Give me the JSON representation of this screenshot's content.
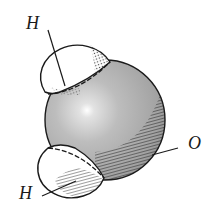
{
  "diagram": {
    "title": "",
    "atoms": [
      {
        "id": "h-top",
        "label": "H",
        "element": "hydrogen",
        "fill": "#ffffff"
      },
      {
        "id": "o",
        "label": "O",
        "element": "oxygen",
        "fill": "#b4b4b4"
      },
      {
        "id": "h-bottom",
        "label": "H",
        "element": "hydrogen",
        "fill": "#ffffff"
      }
    ]
  },
  "colors": {
    "outline": "#1a1a1a",
    "oxygen_fill": "#b4b4b4",
    "oxygen_shadow": "#6e6e6e",
    "hydrogen_fill": "#ffffff",
    "background": "#ffffff"
  }
}
